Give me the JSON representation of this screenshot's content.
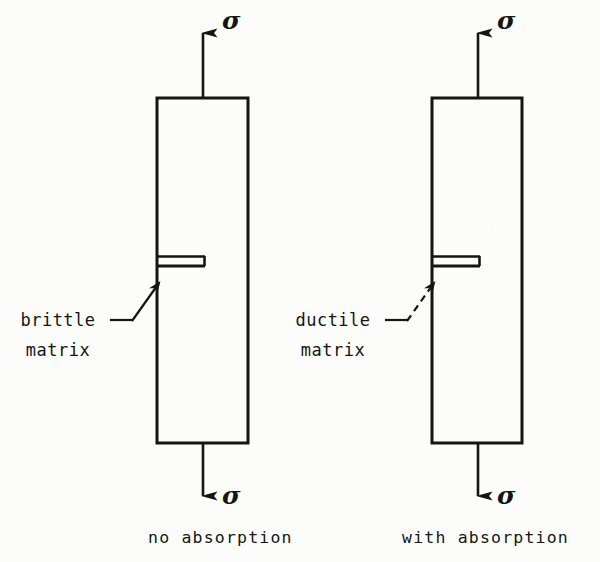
{
  "figure": {
    "background_color": "#fcfcfa",
    "ink_color": "#151515",
    "panels": [
      {
        "id": "left",
        "caption": "no absorption",
        "matrix_label_line1": "brittle",
        "matrix_label_line2": "matrix",
        "leader_style": "solid",
        "stress_symbol_top": "σ",
        "stress_symbol_bottom": "σ",
        "specimen": {
          "x": 157,
          "y": 98,
          "width": 91,
          "height": 345
        },
        "slot": {
          "x": 157,
          "y": 256,
          "width": 48,
          "height": 10
        }
      },
      {
        "id": "right",
        "caption": "with absorption",
        "matrix_label_line1": "ductile",
        "matrix_label_line2": "matrix",
        "leader_style": "dashed",
        "stress_symbol_top": "σ",
        "stress_symbol_bottom": "σ",
        "specimen": {
          "x": 432,
          "y": 98,
          "width": 90,
          "height": 345
        },
        "slot": {
          "x": 432,
          "y": 256,
          "width": 48,
          "height": 10
        }
      }
    ]
  }
}
